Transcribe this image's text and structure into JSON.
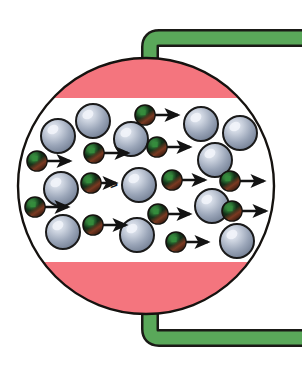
{
  "figure": {
    "width": 302,
    "height": 372,
    "background_color": "#ffffff"
  },
  "colors": {
    "background": "#ffffff",
    "tube_fill": "#5aa85a",
    "tube_stroke": "#1a1a16",
    "band_pink": "#f4757e",
    "circle_fill": "#ffffff",
    "circle_stroke": "#15120f",
    "sphere_outline": "#1a1a1a",
    "sphere_light": "#cdd4e0",
    "sphere_mid": "#9aa5b8",
    "sphere_dark": "#6f7b90",
    "particle_dark": "#14120e",
    "particle_green": "#2f7a37",
    "particle_rim": "#7a3a22",
    "arrow_color": "#131313"
  },
  "vessel": {
    "label": "membrane-circle",
    "center_x": 146,
    "center_y": 186,
    "radius_x": 128,
    "radius_y": 128,
    "stroke_width": 2.4
  },
  "bands": [
    {
      "name": "top-pink-band",
      "label": "upper pink region",
      "color": "#f4757e",
      "y_top": 58,
      "y_bottom": 98
    },
    {
      "name": "bottom-pink-band",
      "label": "lower pink region",
      "color": "#f4757e",
      "y_top": 262,
      "y_bottom": 314
    }
  ],
  "tubes": [
    {
      "name": "tube-top",
      "label": "upper green tube",
      "corner_x": 150,
      "corner_y": 38,
      "vertical_end_y": 96,
      "thickness": 13,
      "orientation": "top"
    },
    {
      "name": "tube-bottom",
      "label": "lower green tube",
      "corner_x": 150,
      "corner_y": 338,
      "vertical_end_y": 300,
      "thickness": 13,
      "orientation": "bottom"
    }
  ],
  "spheres": [
    {
      "cx": 58,
      "cy": 136,
      "r": 17
    },
    {
      "cx": 93,
      "cy": 121,
      "r": 17
    },
    {
      "cx": 131,
      "cy": 139,
      "r": 17
    },
    {
      "cx": 201,
      "cy": 124,
      "r": 17
    },
    {
      "cx": 240,
      "cy": 133,
      "r": 17
    },
    {
      "cx": 61,
      "cy": 189,
      "r": 17
    },
    {
      "cx": 215,
      "cy": 160,
      "r": 17
    },
    {
      "cx": 139,
      "cy": 185,
      "r": 17
    },
    {
      "cx": 63,
      "cy": 232,
      "r": 17
    },
    {
      "cx": 212,
      "cy": 206,
      "r": 17
    },
    {
      "cx": 137,
      "cy": 235,
      "r": 17
    },
    {
      "cx": 237,
      "cy": 241,
      "r": 17
    }
  ],
  "particles": [
    {
      "cx": 37,
      "cy": 161,
      "r": 10,
      "arrow": {
        "x1": 47,
        "y1": 161,
        "x2": 70,
        "y2": 161
      }
    },
    {
      "cx": 94,
      "cy": 153,
      "r": 10,
      "arrow": {
        "x1": 104,
        "y1": 153,
        "x2": 128,
        "y2": 153
      }
    },
    {
      "cx": 145,
      "cy": 115,
      "r": 10,
      "arrow": {
        "x1": 155,
        "y1": 115,
        "x2": 178,
        "y2": 115
      }
    },
    {
      "cx": 157,
      "cy": 147,
      "r": 10,
      "arrow": {
        "x1": 167,
        "y1": 147,
        "x2": 190,
        "y2": 147
      }
    },
    {
      "cx": 91,
      "cy": 183,
      "r": 10,
      "arrow": {
        "x1": 101,
        "y1": 183,
        "x2": 116,
        "y2": 183
      }
    },
    {
      "cx": 172,
      "cy": 180,
      "r": 10,
      "arrow": {
        "x1": 182,
        "y1": 180,
        "x2": 205,
        "y2": 180
      }
    },
    {
      "cx": 230,
      "cy": 181,
      "r": 10,
      "arrow": {
        "x1": 240,
        "y1": 181,
        "x2": 264,
        "y2": 181
      }
    },
    {
      "cx": 35,
      "cy": 207,
      "r": 10,
      "arrow": {
        "x1": 45,
        "y1": 207,
        "x2": 68,
        "y2": 207
      }
    },
    {
      "cx": 93,
      "cy": 225,
      "r": 10,
      "arrow": {
        "x1": 103,
        "y1": 225,
        "x2": 126,
        "y2": 225
      }
    },
    {
      "cx": 158,
      "cy": 214,
      "r": 10,
      "arrow": {
        "x1": 168,
        "y1": 214,
        "x2": 190,
        "y2": 214
      }
    },
    {
      "cx": 232,
      "cy": 211,
      "r": 10,
      "arrow": {
        "x1": 242,
        "y1": 211,
        "x2": 266,
        "y2": 211
      }
    },
    {
      "cx": 176,
      "cy": 242,
      "r": 10,
      "arrow": {
        "x1": 186,
        "y1": 242,
        "x2": 208,
        "y2": 242
      }
    }
  ],
  "small_marker": {
    "name": "small-chevron-marker",
    "x": 114,
    "y": 184,
    "glyph": ">"
  }
}
